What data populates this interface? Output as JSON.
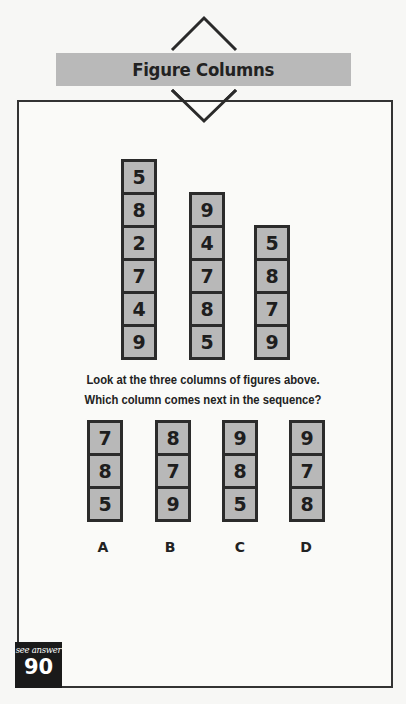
{
  "header": {
    "title": "Figure Columns",
    "banner_color": "#b9b9b9"
  },
  "puzzle": {
    "columns": [
      {
        "values": [
          "5",
          "8",
          "2",
          "7",
          "4",
          "9"
        ]
      },
      {
        "values": [
          "9",
          "4",
          "7",
          "8",
          "5"
        ]
      },
      {
        "values": [
          "5",
          "8",
          "7",
          "9"
        ]
      }
    ],
    "question_line1": "Look at the three columns of figures above.",
    "question_line2": "Which column comes next in the sequence?",
    "options": [
      {
        "label": "A",
        "values": [
          "7",
          "8",
          "5"
        ]
      },
      {
        "label": "B",
        "values": [
          "8",
          "7",
          "9"
        ]
      },
      {
        "label": "C",
        "values": [
          "9",
          "8",
          "5"
        ]
      },
      {
        "label": "D",
        "values": [
          "9",
          "7",
          "8"
        ]
      }
    ]
  },
  "footer": {
    "caption": "see answer",
    "answer_number": "90"
  },
  "colors": {
    "cell_fill": "#b8b8b8",
    "cell_border": "#2b2b2b"
  }
}
